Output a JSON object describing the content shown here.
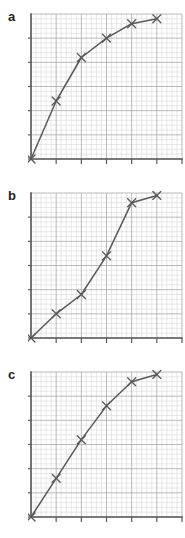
{
  "figure": {
    "type": "multi-panel-line-chart",
    "panel_count": 3,
    "background": "#ffffff",
    "grid_minor_color": "#d9d9d9",
    "grid_major_color": "#a8a8a8",
    "axis_color": "#58595b",
    "line_color": "#58595b",
    "marker": "x",
    "label_color": "#231f20"
  },
  "panels": [
    {
      "label": "a",
      "id": "panel-a"
    },
    {
      "label": "b",
      "id": "panel-b"
    },
    {
      "label": "c",
      "id": "panel-c"
    }
  ],
  "chart_data": [
    {
      "type": "line",
      "title": "a",
      "xlabel": "",
      "ylabel": "",
      "xlim": [
        0,
        30
      ],
      "ylim": [
        0,
        30
      ],
      "grid": true,
      "grid_minor_step": 1,
      "grid_major_step": 5,
      "legend": "none",
      "marker": "x",
      "shape": "concave-increasing (logarithmic / saturating)",
      "x": [
        0,
        5,
        10,
        15,
        20,
        25
      ],
      "y": [
        0,
        12,
        21,
        25,
        28,
        29
      ],
      "xticks": [
        0,
        5,
        10,
        15,
        20,
        25
      ],
      "yticks": [
        0,
        5,
        10,
        15,
        20,
        25
      ],
      "xticklabels": [
        "",
        "",
        "",
        "",
        "",
        ""
      ],
      "yticklabels": [
        "",
        "",
        "",
        "",
        "",
        ""
      ]
    },
    {
      "type": "line",
      "title": "b",
      "xlabel": "",
      "ylabel": "",
      "xlim": [
        0,
        30
      ],
      "ylim": [
        0,
        30
      ],
      "grid": true,
      "grid_minor_step": 1,
      "grid_major_step": 5,
      "legend": "none",
      "marker": "x",
      "shape": "sigmoid S-curve",
      "x": [
        0,
        5,
        10,
        15,
        20,
        25
      ],
      "y": [
        0,
        5,
        9,
        17,
        28,
        29.5
      ],
      "xticks": [
        0,
        5,
        10,
        15,
        20,
        25
      ],
      "yticks": [
        0,
        5,
        10,
        15,
        20,
        25
      ],
      "xticklabels": [
        "",
        "",
        "",
        "",
        "",
        ""
      ],
      "yticklabels": [
        "",
        "",
        "",
        "",
        "",
        ""
      ]
    },
    {
      "type": "line",
      "title": "c",
      "xlabel": "",
      "ylabel": "",
      "xlim": [
        0,
        30
      ],
      "ylim": [
        0,
        30
      ],
      "grid": true,
      "grid_minor_step": 1,
      "grid_major_step": 5,
      "legend": "none",
      "marker": "x",
      "shape": "near-linear with slight flattening",
      "x": [
        0,
        5,
        10,
        15,
        20,
        25
      ],
      "y": [
        0,
        8,
        16,
        23,
        28,
        29.5
      ],
      "xticks": [
        0,
        5,
        10,
        15,
        20,
        25
      ],
      "yticks": [
        0,
        5,
        10,
        15,
        20,
        25
      ],
      "xticklabels": [
        "",
        "",
        "",
        "",
        "",
        ""
      ],
      "yticklabels": [
        "",
        "",
        "",
        "",
        "",
        ""
      ]
    }
  ]
}
